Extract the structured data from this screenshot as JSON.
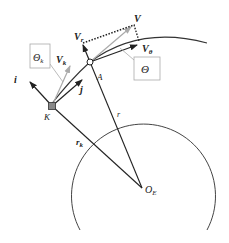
{
  "labels": {
    "i": "i",
    "j": "j",
    "K": "K",
    "A": "A",
    "V": "V",
    "Vr": "V",
    "Vr_sub": "r",
    "Vtheta": "V",
    "Vtheta_sub": "θ",
    "Vk": "V",
    "Vk_sub": "k",
    "Theta": "Θ",
    "Theta_k": "Θ",
    "Theta_k_sub": "k",
    "r": "r",
    "rk": "r",
    "rk_sub": "k",
    "OE": "O",
    "OE_sub": "E"
  },
  "colors": {
    "line": "#222222",
    "grey": "#999999",
    "box": "#aaaaaa"
  }
}
